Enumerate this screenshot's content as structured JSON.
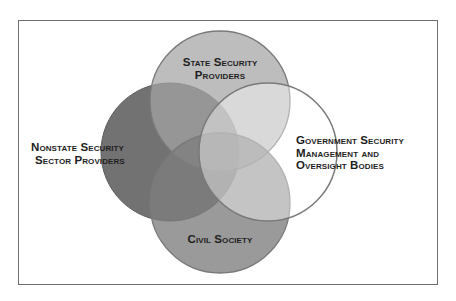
{
  "diagram": {
    "type": "venn",
    "frame": {
      "border_color": "#6f6f6f",
      "background": "#ffffff"
    },
    "circles": [
      {
        "id": "nonstate",
        "label_lines": [
          "Nonstate Security",
          "Sector Providers"
        ],
        "cx": 170,
        "cy": 152,
        "r": 69,
        "fill": "#606060",
        "opacity": 0.88
      },
      {
        "id": "state",
        "label_lines": [
          "State Security",
          "Providers"
        ],
        "cx": 220,
        "cy": 101,
        "r": 70,
        "fill": "#a8a8a8",
        "opacity": 0.8
      },
      {
        "id": "civil",
        "label_lines": [
          "Civil Society"
        ],
        "cx": 220,
        "cy": 203,
        "r": 70,
        "fill": "#8a8a8a",
        "opacity": 0.85
      },
      {
        "id": "government",
        "label_lines": [
          "Government Security",
          "Management and",
          "Oversight Bodies"
        ],
        "cx": 268,
        "cy": 152,
        "r": 69,
        "fill": "#ffffff",
        "opacity": 0.45
      }
    ],
    "stroke_color": "#7a7a7a",
    "labels": {
      "state": {
        "line1": "State Security",
        "line2": "Providers"
      },
      "nonstate": {
        "line1": "Nonstate Security",
        "line2": "Sector Providers"
      },
      "government": {
        "line1": "Government Security",
        "line2": "Management and",
        "line3": "Oversight Bodies"
      },
      "civil": {
        "line1": "Civil Society"
      }
    }
  }
}
